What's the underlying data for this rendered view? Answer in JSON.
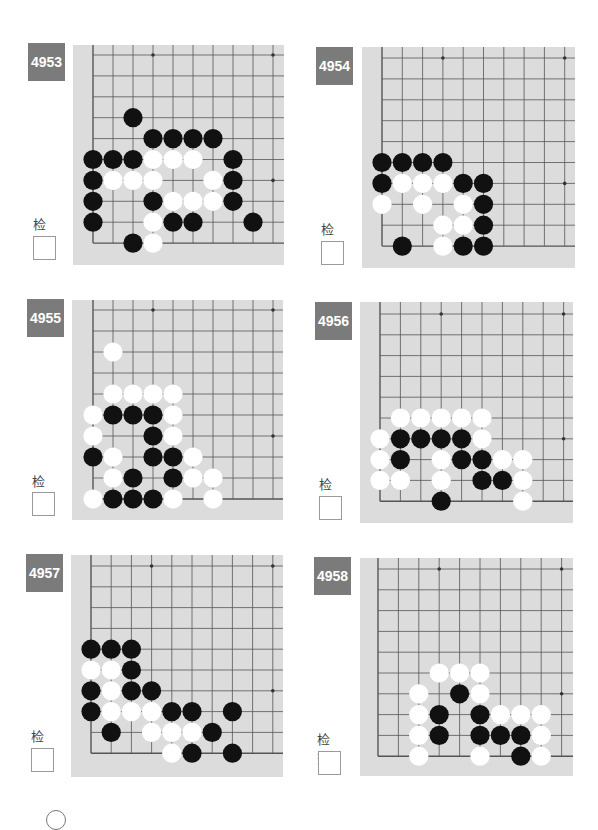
{
  "problems": [
    {
      "id": "4953",
      "check_label": "检查",
      "pos": {
        "label": [
          28,
          43
        ],
        "board": [
          73,
          45,
          211,
          220
        ],
        "grid_origin": [
          20,
          10
        ],
        "cell": [
          20,
          20.9
        ],
        "check_text": [
          33,
          214
        ],
        "check_box": [
          33,
          236
        ]
      },
      "stones": [
        {
          "c": 2,
          "r": 6,
          "color": "black"
        },
        {
          "c": 3,
          "r": 5,
          "color": "black"
        },
        {
          "c": 4,
          "r": 5,
          "color": "black"
        },
        {
          "c": 5,
          "r": 5,
          "color": "black"
        },
        {
          "c": 6,
          "r": 5,
          "color": "black"
        },
        {
          "c": 0,
          "r": 4,
          "color": "black"
        },
        {
          "c": 1,
          "r": 4,
          "color": "black"
        },
        {
          "c": 2,
          "r": 4,
          "color": "black"
        },
        {
          "c": 3,
          "r": 4,
          "color": "white"
        },
        {
          "c": 4,
          "r": 4,
          "color": "white"
        },
        {
          "c": 5,
          "r": 4,
          "color": "white"
        },
        {
          "c": 7,
          "r": 4,
          "color": "black"
        },
        {
          "c": 0,
          "r": 3,
          "color": "black"
        },
        {
          "c": 1,
          "r": 3,
          "color": "white"
        },
        {
          "c": 2,
          "r": 3,
          "color": "white"
        },
        {
          "c": 3,
          "r": 3,
          "color": "white"
        },
        {
          "c": 6,
          "r": 3,
          "color": "white"
        },
        {
          "c": 7,
          "r": 3,
          "color": "black"
        },
        {
          "c": 0,
          "r": 2,
          "color": "black"
        },
        {
          "c": 3,
          "r": 2,
          "color": "black"
        },
        {
          "c": 4,
          "r": 2,
          "color": "white"
        },
        {
          "c": 5,
          "r": 2,
          "color": "white"
        },
        {
          "c": 6,
          "r": 2,
          "color": "white"
        },
        {
          "c": 7,
          "r": 2,
          "color": "black"
        },
        {
          "c": 0,
          "r": 1,
          "color": "black"
        },
        {
          "c": 3,
          "r": 1,
          "color": "white"
        },
        {
          "c": 4,
          "r": 1,
          "color": "black"
        },
        {
          "c": 5,
          "r": 1,
          "color": "black"
        },
        {
          "c": 8,
          "r": 1,
          "color": "black"
        },
        {
          "c": 2,
          "r": 0,
          "color": "black"
        },
        {
          "c": 3,
          "r": 0,
          "color": "white"
        }
      ]
    },
    {
      "id": "4954",
      "check_label": "检查",
      "pos": {
        "label": [
          316,
          47
        ],
        "board": [
          362,
          47,
          213,
          221
        ],
        "grid_origin": [
          20,
          11
        ],
        "cell": [
          20.3,
          20.9
        ],
        "check_text": [
          321,
          219
        ],
        "check_box": [
          321,
          241
        ]
      },
      "stones": [
        {
          "c": 0,
          "r": 4,
          "color": "black"
        },
        {
          "c": 1,
          "r": 4,
          "color": "black"
        },
        {
          "c": 2,
          "r": 4,
          "color": "black"
        },
        {
          "c": 3,
          "r": 4,
          "color": "black"
        },
        {
          "c": 0,
          "r": 3,
          "color": "black"
        },
        {
          "c": 1,
          "r": 3,
          "color": "white"
        },
        {
          "c": 2,
          "r": 3,
          "color": "white"
        },
        {
          "c": 3,
          "r": 3,
          "color": "white"
        },
        {
          "c": 4,
          "r": 3,
          "color": "black"
        },
        {
          "c": 5,
          "r": 3,
          "color": "black"
        },
        {
          "c": 0,
          "r": 2,
          "color": "white"
        },
        {
          "c": 2,
          "r": 2,
          "color": "white"
        },
        {
          "c": 4,
          "r": 2,
          "color": "white"
        },
        {
          "c": 5,
          "r": 2,
          "color": "black"
        },
        {
          "c": 3,
          "r": 1,
          "color": "white"
        },
        {
          "c": 4,
          "r": 1,
          "color": "white"
        },
        {
          "c": 5,
          "r": 1,
          "color": "black"
        },
        {
          "c": 1,
          "r": 0,
          "color": "black"
        },
        {
          "c": 3,
          "r": 0,
          "color": "white"
        },
        {
          "c": 4,
          "r": 0,
          "color": "black"
        },
        {
          "c": 5,
          "r": 0,
          "color": "black"
        }
      ]
    },
    {
      "id": "4955",
      "check_label": "检查",
      "pos": {
        "label": [
          27,
          299
        ],
        "board": [
          72,
          300,
          211,
          220
        ],
        "grid_origin": [
          21,
          10
        ],
        "cell": [
          20,
          21
        ],
        "check_text": [
          32,
          471
        ],
        "check_box": [
          32,
          492
        ]
      },
      "stones": [
        {
          "c": 1,
          "r": 7,
          "color": "white"
        },
        {
          "c": 1,
          "r": 5,
          "color": "white"
        },
        {
          "c": 2,
          "r": 5,
          "color": "white"
        },
        {
          "c": 3,
          "r": 5,
          "color": "white"
        },
        {
          "c": 4,
          "r": 5,
          "color": "white"
        },
        {
          "c": 0,
          "r": 4,
          "color": "white"
        },
        {
          "c": 1,
          "r": 4,
          "color": "black"
        },
        {
          "c": 2,
          "r": 4,
          "color": "black"
        },
        {
          "c": 3,
          "r": 4,
          "color": "black"
        },
        {
          "c": 4,
          "r": 4,
          "color": "white"
        },
        {
          "c": 0,
          "r": 3,
          "color": "white"
        },
        {
          "c": 3,
          "r": 3,
          "color": "black"
        },
        {
          "c": 4,
          "r": 3,
          "color": "white"
        },
        {
          "c": 0,
          "r": 2,
          "color": "black"
        },
        {
          "c": 1,
          "r": 2,
          "color": "white"
        },
        {
          "c": 3,
          "r": 2,
          "color": "black"
        },
        {
          "c": 4,
          "r": 2,
          "color": "black"
        },
        {
          "c": 5,
          "r": 2,
          "color": "white"
        },
        {
          "c": 1,
          "r": 1,
          "color": "white"
        },
        {
          "c": 2,
          "r": 1,
          "color": "black"
        },
        {
          "c": 4,
          "r": 1,
          "color": "black"
        },
        {
          "c": 5,
          "r": 1,
          "color": "white"
        },
        {
          "c": 6,
          "r": 1,
          "color": "white"
        },
        {
          "c": 0,
          "r": 0,
          "color": "white"
        },
        {
          "c": 1,
          "r": 0,
          "color": "black"
        },
        {
          "c": 2,
          "r": 0,
          "color": "black"
        },
        {
          "c": 3,
          "r": 0,
          "color": "black"
        },
        {
          "c": 4,
          "r": 0,
          "color": "white"
        },
        {
          "c": 6,
          "r": 0,
          "color": "white"
        }
      ]
    },
    {
      "id": "4956",
      "check_label": "检查",
      "pos": {
        "label": [
          315,
          302
        ],
        "board": [
          360,
          302,
          213,
          221
        ],
        "grid_origin": [
          20,
          12
        ],
        "cell": [
          20.4,
          20.8
        ],
        "check_text": [
          319,
          474
        ],
        "check_box": [
          319,
          496
        ]
      },
      "stones": [
        {
          "c": 1,
          "r": 4,
          "color": "white"
        },
        {
          "c": 2,
          "r": 4,
          "color": "white"
        },
        {
          "c": 3,
          "r": 4,
          "color": "white"
        },
        {
          "c": 4,
          "r": 4,
          "color": "white"
        },
        {
          "c": 5,
          "r": 4,
          "color": "white"
        },
        {
          "c": 0,
          "r": 3,
          "color": "white"
        },
        {
          "c": 1,
          "r": 3,
          "color": "black"
        },
        {
          "c": 2,
          "r": 3,
          "color": "black"
        },
        {
          "c": 3,
          "r": 3,
          "color": "black"
        },
        {
          "c": 4,
          "r": 3,
          "color": "black"
        },
        {
          "c": 5,
          "r": 3,
          "color": "white"
        },
        {
          "c": 0,
          "r": 2,
          "color": "white"
        },
        {
          "c": 1,
          "r": 2,
          "color": "black"
        },
        {
          "c": 3,
          "r": 2,
          "color": "white"
        },
        {
          "c": 4,
          "r": 2,
          "color": "black"
        },
        {
          "c": 5,
          "r": 2,
          "color": "black"
        },
        {
          "c": 6,
          "r": 2,
          "color": "white"
        },
        {
          "c": 7,
          "r": 2,
          "color": "white"
        },
        {
          "c": 0,
          "r": 1,
          "color": "white"
        },
        {
          "c": 1,
          "r": 1,
          "color": "white"
        },
        {
          "c": 3,
          "r": 1,
          "color": "white"
        },
        {
          "c": 5,
          "r": 1,
          "color": "black"
        },
        {
          "c": 6,
          "r": 1,
          "color": "black"
        },
        {
          "c": 7,
          "r": 1,
          "color": "white"
        },
        {
          "c": 3,
          "r": 0,
          "color": "black"
        },
        {
          "c": 7,
          "r": 0,
          "color": "white"
        }
      ]
    },
    {
      "id": "4957",
      "check_label": "检查",
      "pos": {
        "label": [
          26,
          554
        ],
        "board": [
          71,
          555,
          212,
          222
        ],
        "grid_origin": [
          20,
          11
        ],
        "cell": [
          20.2,
          20.8
        ],
        "check_text": [
          31,
          726
        ],
        "check_box": [
          31,
          748
        ]
      },
      "stones": [
        {
          "c": 0,
          "r": 5,
          "color": "black"
        },
        {
          "c": 1,
          "r": 5,
          "color": "black"
        },
        {
          "c": 2,
          "r": 5,
          "color": "black"
        },
        {
          "c": 0,
          "r": 4,
          "color": "white"
        },
        {
          "c": 1,
          "r": 4,
          "color": "white"
        },
        {
          "c": 2,
          "r": 4,
          "color": "black"
        },
        {
          "c": 0,
          "r": 3,
          "color": "black"
        },
        {
          "c": 1,
          "r": 3,
          "color": "white"
        },
        {
          "c": 2,
          "r": 3,
          "color": "black"
        },
        {
          "c": 3,
          "r": 3,
          "color": "black"
        },
        {
          "c": 0,
          "r": 2,
          "color": "black"
        },
        {
          "c": 1,
          "r": 2,
          "color": "white"
        },
        {
          "c": 2,
          "r": 2,
          "color": "white"
        },
        {
          "c": 3,
          "r": 2,
          "color": "white"
        },
        {
          "c": 4,
          "r": 2,
          "color": "black"
        },
        {
          "c": 5,
          "r": 2,
          "color": "black"
        },
        {
          "c": 7,
          "r": 2,
          "color": "black"
        },
        {
          "c": 1,
          "r": 1,
          "color": "black"
        },
        {
          "c": 3,
          "r": 1,
          "color": "white"
        },
        {
          "c": 4,
          "r": 1,
          "color": "white"
        },
        {
          "c": 5,
          "r": 1,
          "color": "white"
        },
        {
          "c": 6,
          "r": 1,
          "color": "black"
        },
        {
          "c": 4,
          "r": 0,
          "color": "white"
        },
        {
          "c": 5,
          "r": 0,
          "color": "black"
        },
        {
          "c": 7,
          "r": 0,
          "color": "black"
        }
      ]
    },
    {
      "id": "4958",
      "check_label": "检查",
      "pos": {
        "label": [
          314,
          557
        ],
        "board": [
          360,
          558,
          213,
          218
        ],
        "grid_origin": [
          18,
          11
        ],
        "cell": [
          20.4,
          20.8
        ],
        "check_text": [
          317,
          729
        ],
        "check_box": [
          318,
          751
        ]
      },
      "stones": [
        {
          "c": 3,
          "r": 4,
          "color": "white"
        },
        {
          "c": 4,
          "r": 4,
          "color": "white"
        },
        {
          "c": 5,
          "r": 4,
          "color": "white"
        },
        {
          "c": 2,
          "r": 3,
          "color": "white"
        },
        {
          "c": 4,
          "r": 3,
          "color": "black"
        },
        {
          "c": 5,
          "r": 3,
          "color": "white"
        },
        {
          "c": 2,
          "r": 2,
          "color": "white"
        },
        {
          "c": 3,
          "r": 2,
          "color": "black"
        },
        {
          "c": 5,
          "r": 2,
          "color": "black"
        },
        {
          "c": 6,
          "r": 2,
          "color": "white"
        },
        {
          "c": 7,
          "r": 2,
          "color": "white"
        },
        {
          "c": 8,
          "r": 2,
          "color": "white"
        },
        {
          "c": 2,
          "r": 1,
          "color": "white"
        },
        {
          "c": 3,
          "r": 1,
          "color": "black"
        },
        {
          "c": 5,
          "r": 1,
          "color": "black"
        },
        {
          "c": 6,
          "r": 1,
          "color": "black"
        },
        {
          "c": 7,
          "r": 1,
          "color": "black"
        },
        {
          "c": 8,
          "r": 1,
          "color": "white"
        },
        {
          "c": 2,
          "r": 0,
          "color": "white"
        },
        {
          "c": 5,
          "r": 0,
          "color": "white"
        },
        {
          "c": 7,
          "r": 0,
          "color": "black"
        },
        {
          "c": 8,
          "r": 0,
          "color": "white"
        }
      ]
    }
  ],
  "grid": {
    "cols": 10,
    "rows": 10,
    "star_points": [
      {
        "c": 3,
        "r": 9
      },
      {
        "c": 9,
        "r": 9
      },
      {
        "c": 9,
        "r": 3
      }
    ]
  },
  "colors": {
    "label_bg": "#7b7b7b",
    "board_bg": "#dcdcdc",
    "line": "#555555",
    "black_stone": "#111111",
    "white_stone": "#ffffff"
  }
}
